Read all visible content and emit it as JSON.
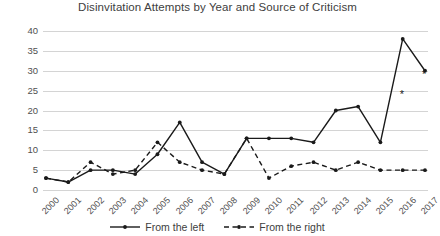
{
  "chart_data": {
    "type": "line",
    "title": "Disinvitation Attempts by Year and Source of Criticism",
    "xlabel": "",
    "ylabel": "",
    "ylim": [
      0,
      40
    ],
    "ytick_step": 5,
    "yticks": [
      "0",
      "5",
      "10",
      "15",
      "20",
      "25",
      "30",
      "35",
      "40"
    ],
    "grid": true,
    "legend_position": "bottom",
    "categories": [
      "2000",
      "2001",
      "2002",
      "2003",
      "2004",
      "2005",
      "2006",
      "2007",
      "2008",
      "2009",
      "2010",
      "2011",
      "2012",
      "2013",
      "2014",
      "2015",
      "2016",
      "2017"
    ],
    "series": [
      {
        "name": "From the left",
        "style": "solid",
        "color": "#1a1a1a",
        "marker": "dot",
        "values": [
          3,
          2,
          5,
          5,
          4,
          9,
          17,
          7,
          4,
          13,
          13,
          13,
          12,
          20,
          21,
          12,
          38,
          30
        ]
      },
      {
        "name": "From the right",
        "style": "dashed",
        "color": "#1a1a1a",
        "marker": "dot",
        "values": [
          3,
          2,
          7,
          4,
          5,
          12,
          7,
          5,
          4,
          13,
          3,
          6,
          7,
          5,
          7,
          5,
          5,
          5
        ]
      }
    ],
    "annotations": [
      {
        "text": "*",
        "x_value": 2016,
        "y_value": 24
      },
      {
        "text": "*",
        "x_value": 2017,
        "y_value": 29
      }
    ]
  },
  "legend": {
    "entries": [
      {
        "label": "From the left"
      },
      {
        "label": "From the right"
      }
    ]
  }
}
